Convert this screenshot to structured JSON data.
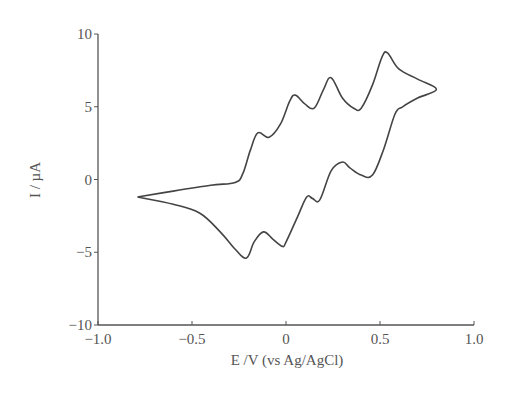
{
  "chart_data": {
    "type": "line",
    "title": "",
    "xlabel": "E /V (vs Ag/AgCl)",
    "ylabel": "I / µA",
    "xlim": [
      -1.0,
      1.0
    ],
    "ylim": [
      -10,
      10
    ],
    "xticks": [
      -1.0,
      -0.5,
      0,
      0.5,
      1.0
    ],
    "xtick_labels": [
      "−1.0",
      "−0.5",
      "0",
      "0.5",
      "1.0"
    ],
    "yticks": [
      10,
      5,
      0,
      -5,
      -10
    ],
    "ytick_labels": [
      "10",
      "5",
      "0",
      "−5",
      "−10"
    ],
    "grid": false,
    "legend": null,
    "series": [
      {
        "name": "cyclic voltammogram",
        "x": [
          -0.79,
          -0.6,
          -0.4,
          -0.27,
          -0.23,
          -0.19,
          -0.15,
          -0.09,
          -0.03,
          0.02,
          0.05,
          0.1,
          0.15,
          0.2,
          0.24,
          0.3,
          0.36,
          0.4,
          0.46,
          0.51,
          0.54,
          0.6,
          0.7,
          0.8,
          0.7,
          0.62,
          0.58,
          0.52,
          0.46,
          0.4,
          0.34,
          0.3,
          0.24,
          0.18,
          0.14,
          0.11,
          0.06,
          0.0,
          -0.02,
          -0.07,
          -0.12,
          -0.17,
          -0.21,
          -0.27,
          -0.35,
          -0.46,
          -0.6,
          -0.79
        ],
        "y": [
          -1.2,
          -0.8,
          -0.4,
          -0.2,
          0.4,
          2.0,
          3.2,
          2.9,
          3.8,
          5.4,
          5.8,
          5.2,
          4.9,
          6.2,
          7.0,
          5.6,
          4.9,
          4.9,
          6.5,
          8.4,
          8.7,
          7.6,
          6.9,
          6.2,
          5.6,
          5.0,
          4.5,
          2.1,
          0.3,
          0.3,
          0.8,
          1.2,
          0.6,
          -1.4,
          -1.3,
          -1.2,
          -2.6,
          -4.3,
          -4.6,
          -4.1,
          -3.6,
          -4.3,
          -5.4,
          -4.8,
          -3.6,
          -2.3,
          -1.7,
          -1.2
        ]
      }
    ],
    "line_color": "#444444"
  }
}
